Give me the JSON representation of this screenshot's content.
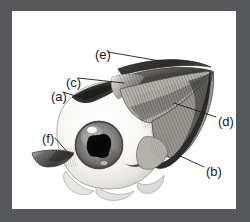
{
  "figure": {
    "border_color": "#55575a",
    "panel_color": "#ffffff",
    "ink_color": "#18191b",
    "width": 250,
    "height": 222
  },
  "labels": [
    {
      "key": "e",
      "text": "(e)",
      "x": 83,
      "y": 37,
      "leader_to_x": 148,
      "leader_to_y": 50
    },
    {
      "key": "c",
      "text": "(c)",
      "x": 54,
      "y": 65,
      "leader_to_x": 113,
      "leader_to_y": 72
    },
    {
      "key": "a",
      "text": "(a)",
      "x": 39,
      "y": 79,
      "leader_to_x": 70,
      "leader_to_y": 87
    },
    {
      "key": "d",
      "text": "(d)",
      "x": 206,
      "y": 104,
      "leader_to_x": 163,
      "leader_to_y": 93
    },
    {
      "key": "f",
      "text": "(f)",
      "x": 30,
      "y": 121,
      "leader_to_x": 56,
      "leader_to_y": 143
    },
    {
      "key": "b",
      "text": "(b)",
      "x": 194,
      "y": 154,
      "leader_to_x": 168,
      "leader_to_y": 144
    }
  ],
  "illustration": {
    "type": "anatomical-drawing",
    "subject": "right eyeball, lateral view, with extraocular muscles converging to orbital apex",
    "parts": [
      {
        "name": "sclera",
        "description": "large off-white globe",
        "center_x": 98,
        "center_y": 134,
        "radius": 52
      },
      {
        "name": "iris",
        "description": "gray striated iris disc",
        "center_x": 87,
        "center_y": 134,
        "radius": 23
      },
      {
        "name": "pupil",
        "description": "dark irregular pupil",
        "center_x": 87,
        "center_y": 134,
        "radius": 10
      },
      {
        "name": "superior-muscle-upper",
        "description": "thin dark muscle band along top"
      },
      {
        "name": "superior-muscle-lower",
        "description": "second thin dark muscle band"
      },
      {
        "name": "striated-muscle-fan",
        "description": "fanned striated muscle fibers converging right"
      },
      {
        "name": "lateral-rectus",
        "description": "broad curved dark muscle bundle lower right"
      },
      {
        "name": "inferior-oblique-stub",
        "description": "short muscle stub lower left"
      },
      {
        "name": "optic-apex",
        "description": "convergence point at right, orbital apex",
        "x": 200,
        "y": 62
      }
    ]
  }
}
